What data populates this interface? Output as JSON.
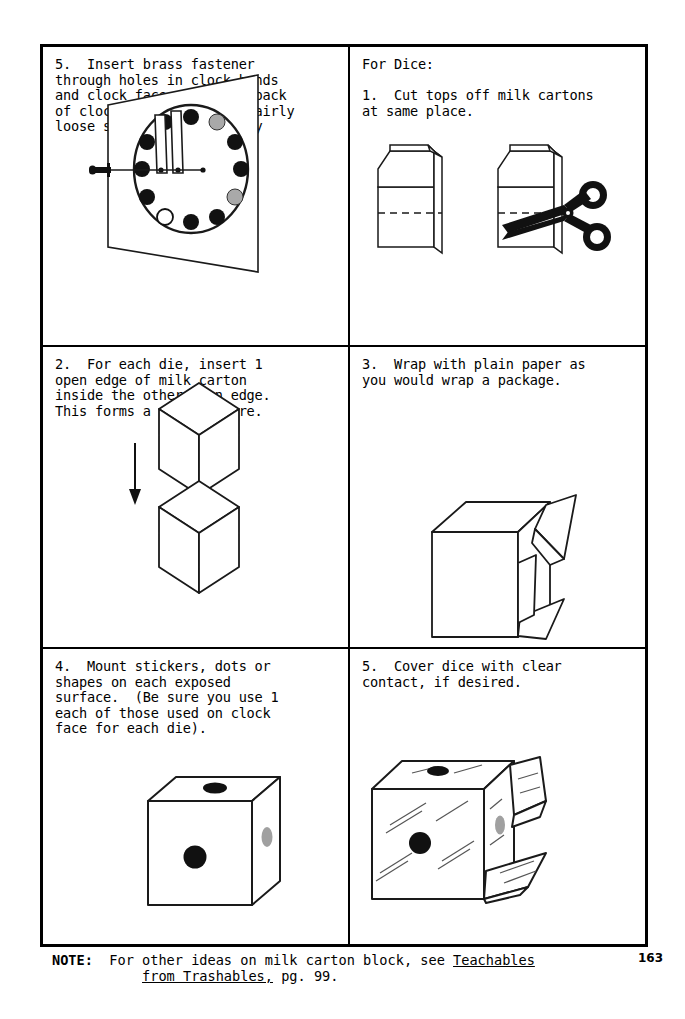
{
  "page": {
    "number": "163",
    "background_color": "#ffffff",
    "ink_color": "#000000"
  },
  "panels": [
    {
      "id": "panel-step5-clock",
      "position": "top-left",
      "text": "5.  Insert brass fastener\nthrough holes in clock hands\nand clock face.  Fold on back\nof clock board; leaving fairly\nloose so hands move easily",
      "illustration": "clock-board-with-brass-fastener"
    },
    {
      "id": "panel-step1-cartons",
      "position": "top-right",
      "text": "For Dice:\n\n1.  Cut tops off milk cartons\nat same place.",
      "illustration": "two-milk-cartons-with-scissors"
    },
    {
      "id": "panel-step2-cubes",
      "position": "middle-left",
      "text": "2.  For each die, insert 1\nopen edge of milk carton\ninside the other open edge.\nThis forms a solid square.",
      "illustration": "two-cubes-with-down-arrow"
    },
    {
      "id": "panel-step3-wrap",
      "position": "middle-right",
      "text": "3.  Wrap with plain paper as\nyou would wrap a package.",
      "illustration": "wrapped-box-with-paper-flaps"
    },
    {
      "id": "panel-step4-stickers",
      "position": "bottom-left",
      "text": "4.  Mount stickers, dots or\nshapes on each exposed\nsurface.  (Be sure you use 1\neach of those used on clock\nface for each die).",
      "illustration": "die-with-dots"
    },
    {
      "id": "panel-step5-contact",
      "position": "bottom-right",
      "text": "5.  Cover dice with clear\ncontact, if desired.",
      "illustration": "die-covered-with-clear-contact"
    }
  ],
  "note": {
    "label": "NOTE:",
    "line1_before": "For other ideas on milk carton block, see ",
    "line1_title": "Teachables",
    "line2_title": "from Trashables,",
    "line2_after": " pg. 99."
  },
  "illustration_details": {
    "clock_dots": {
      "black_count": 9,
      "gray_count": 2,
      "white_count": 1,
      "gray_color": "#a9a9a9"
    },
    "die_dots": {
      "front_color": "#111111",
      "top_color": "#111111",
      "side_color": "#a0a0a0"
    }
  }
}
